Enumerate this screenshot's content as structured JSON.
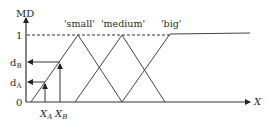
{
  "diagram": {
    "y_axis_label": "MD",
    "x_axis_label": "X",
    "origin_label": "0",
    "one_label": "1",
    "d_b": {
      "main": "d",
      "sub": "B"
    },
    "d_a": {
      "main": "d",
      "sub": "A"
    },
    "x_a": {
      "main": "X",
      "sub": "A"
    },
    "x_b": {
      "main": "X",
      "sub": "B"
    },
    "sets": [
      {
        "label": "'small'"
      },
      {
        "label": "'medium'"
      },
      {
        "label": "'big'"
      }
    ],
    "colors": {
      "line": "#333333",
      "text": "#2a2a2a",
      "background": "#ffffff"
    }
  }
}
